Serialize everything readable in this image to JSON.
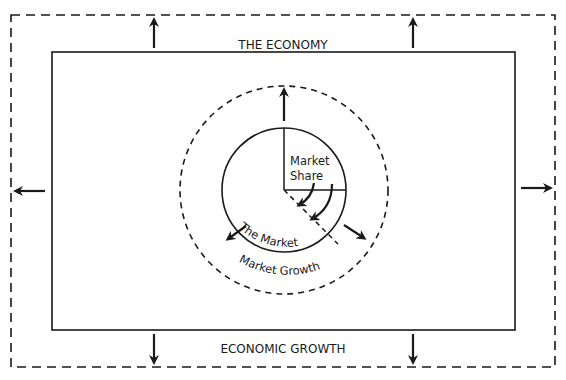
{
  "diagram": {
    "labels": {
      "economy": "THE ECONOMY",
      "economic_growth": "ECONOMIC GROWTH",
      "market_share_line1": "Market",
      "market_share_line2": "Share",
      "the_market": "The Market",
      "market_growth": "Market Growth"
    },
    "colors": {
      "stroke": "#1a1a1a",
      "background": "#ffffff"
    },
    "elements": {
      "outer_boundary": "dashed rectangle (economic growth)",
      "inner_boundary": "solid rectangle (the economy)",
      "market_circle": "solid circle (the market)",
      "growth_circle": "dashed circle (market growth)",
      "share_segment": "quarter sector (market share)"
    }
  }
}
